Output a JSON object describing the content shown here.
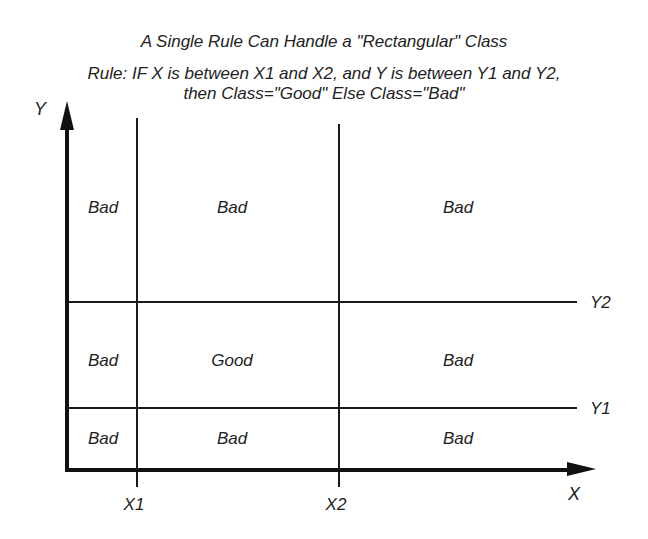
{
  "title": "A Single Rule Can Handle a \"Rectangular\" Class",
  "rule_line1": "Rule: IF X is between X1 and X2, and Y is between Y1 and Y2,",
  "rule_line2": "then Class=\"Good\" Else Class=\"Bad\"",
  "axes": {
    "x_label": "X",
    "y_label": "Y",
    "x_thresholds": [
      "X1",
      "X2"
    ],
    "y_thresholds": [
      "Y2",
      "Y1"
    ]
  },
  "grid": {
    "top_row": [
      "Bad",
      "Bad",
      "Bad"
    ],
    "middle_row": [
      "Bad",
      "Good",
      "Bad"
    ],
    "bottom_row": [
      "Bad",
      "Bad",
      "Bad"
    ]
  }
}
